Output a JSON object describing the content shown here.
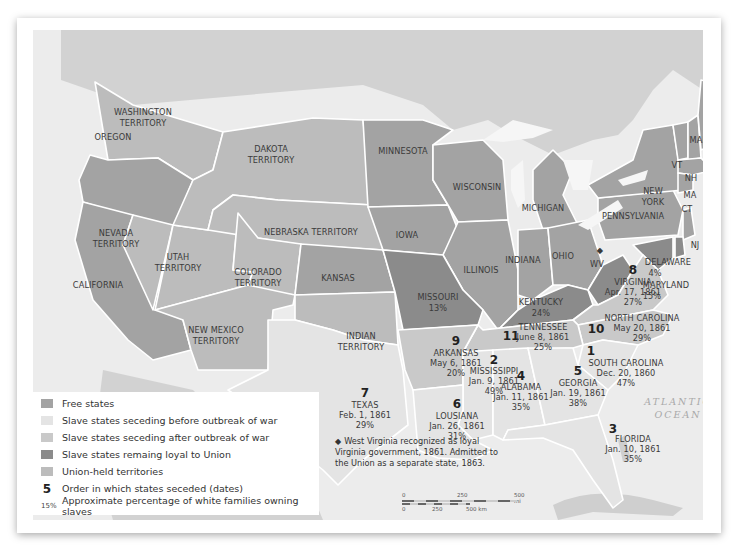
{
  "colors": {
    "free_states": "#a3a3a3",
    "slave_seceding_before": "#e4e4e4",
    "slave_seceding_after": "#c9c9c9",
    "slave_loyal": "#8b8b8b",
    "union_territories": "#bcbcbc",
    "water": "#ececec",
    "foreign_land": "#d2d2d2",
    "border": "#ffffff"
  },
  "regions": {
    "washington": {
      "name": "WASHINGTON",
      "name2": "TERRITORY"
    },
    "oregon": {
      "name": "OREGON"
    },
    "california": {
      "name": "CALIFORNIA"
    },
    "nevada": {
      "name": "NEVADA",
      "name2": "TERRITORY"
    },
    "utah": {
      "name": "UTAH",
      "name2": "TERRITORY"
    },
    "dakota": {
      "name": "DAKOTA",
      "name2": "TERRITORY"
    },
    "nebraska": {
      "name": "NEBRASKA TERRITORY"
    },
    "colorado": {
      "name": "COLORADO",
      "name2": "TERRITORY"
    },
    "new_mexico": {
      "name": "NEW MEXICO",
      "name2": "TERRITORY"
    },
    "kansas": {
      "name": "KANSAS"
    },
    "indian": {
      "name": "INDIAN",
      "name2": "TERRITORY"
    },
    "minnesota": {
      "name": "MINNESOTA"
    },
    "iowa": {
      "name": "IOWA"
    },
    "wisconsin": {
      "name": "WISCONSIN"
    },
    "michigan": {
      "name": "MICHIGAN"
    },
    "illinois": {
      "name": "ILLINOIS"
    },
    "indiana": {
      "name": "INDIANA"
    },
    "ohio": {
      "name": "OHIO"
    },
    "pennsylvania": {
      "name": "PENNSYLVANIA"
    },
    "new_york": {
      "name": "NEW",
      "name2": "YORK"
    },
    "vermont": {
      "name": "VT"
    },
    "new_hampshire": {
      "name": "NH"
    },
    "maine": {
      "name": "MAINE"
    },
    "massachusetts": {
      "name": "MA"
    },
    "connecticut": {
      "name": "CT"
    },
    "rhode_island": {
      "name": "RI"
    },
    "new_jersey": {
      "name": "NJ"
    },
    "missouri": {
      "name": "MISSOURI",
      "pct": "13%"
    },
    "kentucky": {
      "name": "KENTUCKY",
      "pct": "24%"
    },
    "west_virginia": {
      "name": "WV",
      "marker": "◆"
    },
    "delaware": {
      "name": "DELAWARE",
      "pct": "4%"
    },
    "maryland": {
      "name": "MARYLAND",
      "pct": "15%"
    },
    "virginia": {
      "order": "8",
      "name": "VIRGINIA",
      "date": "Apr. 17, 1861",
      "pct": "27%"
    },
    "north_carolina": {
      "order": "10",
      "name": "NORTH CAROLINA",
      "date": "May 20, 1861",
      "pct": "29%"
    },
    "tennessee": {
      "order": "11",
      "name": "TENNESSEE",
      "date": "June 8, 1861",
      "pct": "25%"
    },
    "arkansas": {
      "order": "9",
      "name": "ARKANSAS",
      "date": "May 6, 1861",
      "pct": "20%"
    },
    "south_carolina": {
      "order": "1",
      "name": "SOUTH CAROLINA",
      "date": "Dec. 20, 1860",
      "pct": "47%"
    },
    "mississippi": {
      "order": "2",
      "name": "MISSISSIPPI",
      "date": "Jan. 9, 1861",
      "pct": "49%"
    },
    "florida": {
      "order": "3",
      "name": "FLORIDA",
      "date": "Jan. 10, 1861",
      "pct": "35%"
    },
    "alabama": {
      "order": "4",
      "name": "ALABAMA",
      "date": "Jan. 11, 1861",
      "pct": "35%"
    },
    "georgia": {
      "order": "5",
      "name": "GEORGIA",
      "date": "Jan. 19, 1861",
      "pct": "38%"
    },
    "louisiana": {
      "order": "6",
      "name": "LOUSIANA",
      "date": "Jan. 26, 1861",
      "pct": "31%"
    },
    "texas": {
      "order": "7",
      "name": "TEXAS",
      "date": "Feb. 1, 1861",
      "pct": "29%"
    }
  },
  "ocean": {
    "line1": "ATLANTIC",
    "line2": "OCEAN"
  },
  "legend": {
    "items": [
      {
        "label": "Free states"
      },
      {
        "label": "Slave states seceding before outbreak of war"
      },
      {
        "label": "Slave states seceding after outbreak of war"
      },
      {
        "label": "Slave states remaing loyal to Union"
      },
      {
        "label": "Union-held territories"
      }
    ],
    "order_symbol": "5",
    "order_label": "Order in which states seceded (dates)",
    "pct_symbol": "15%",
    "pct_label": "Approximate percentage of white families owning slaves"
  },
  "note": {
    "symbol": "◆",
    "text": "West Virginia recognized as loyal Virginia government, 1861.  Admitted to the Union as a separate state, 1863."
  },
  "scale": {
    "mi_0": "0",
    "mi_250": "250",
    "mi_500": "500 mi",
    "km_0": "0",
    "km_250": "250",
    "km_500": "500 km"
  }
}
